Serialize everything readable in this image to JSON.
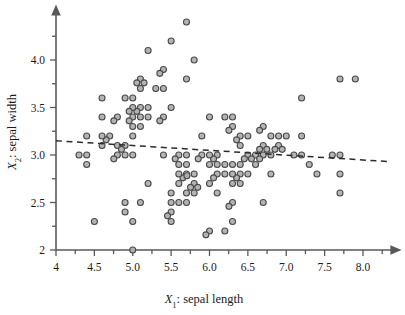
{
  "figure": {
    "background_color": "#ffffff",
    "marker_fill": "#b0b0b0",
    "marker_stroke": "#4a4a4a",
    "axis_color": "#58585a",
    "fitline_color": "#2b2b2b"
  },
  "axes": {
    "x_title_var": "X",
    "x_title_sub": "1",
    "x_title_rest": ": sepal length",
    "x_title_full": "X1: sepal length",
    "y_title_var": "X",
    "y_title_sub": "2",
    "y_title_rest": ": sepal width",
    "y_title_full": "X2: sepal width",
    "x_tick_labels": [
      "4",
      "4.5",
      "5.0",
      "5.5",
      "6.0",
      "6.5",
      "7.0",
      "7.5",
      "8.0"
    ],
    "y_tick_labels": [
      "2",
      "2.5",
      "3.0",
      "3.5",
      "4.0"
    ]
  },
  "chart_data": {
    "type": "scatter",
    "title": "",
    "xlabel": "X1: sepal length",
    "ylabel": "X2: sepal width",
    "xlim": [
      4.0,
      8.35
    ],
    "ylim": [
      2.0,
      4.45
    ],
    "xticks": [
      4.0,
      4.5,
      5.0,
      5.5,
      6.0,
      6.5,
      7.0,
      7.5,
      8.0
    ],
    "xtick_labels": [
      "4",
      "4.5",
      "5.0",
      "5.5",
      "6.0",
      "6.5",
      "7.0",
      "7.5",
      "8.0"
    ],
    "yticks": [
      2.0,
      2.5,
      3.0,
      3.5,
      4.0
    ],
    "ytick_labels": [
      "2",
      "2.5",
      "3.0",
      "3.5",
      "4.0"
    ],
    "grid": false,
    "legend": null,
    "marker": "circle",
    "marker_size": 6,
    "x": [
      5.1,
      4.9,
      4.7,
      4.6,
      5.0,
      5.4,
      4.6,
      5.0,
      4.4,
      4.9,
      5.4,
      4.8,
      4.8,
      4.3,
      5.8,
      5.7,
      5.4,
      5.1,
      5.7,
      5.1,
      5.4,
      5.1,
      4.6,
      5.1,
      4.8,
      5.0,
      5.0,
      5.2,
      5.2,
      4.7,
      4.8,
      5.4,
      5.2,
      5.5,
      4.9,
      5.0,
      5.5,
      4.9,
      4.4,
      5.1,
      5.0,
      4.5,
      4.4,
      5.0,
      5.1,
      4.8,
      5.1,
      4.6,
      5.3,
      5.0,
      7.0,
      6.4,
      6.9,
      5.5,
      6.5,
      5.7,
      6.3,
      4.9,
      6.6,
      5.2,
      5.0,
      5.9,
      6.0,
      6.1,
      5.6,
      6.7,
      5.6,
      5.8,
      6.2,
      5.6,
      5.9,
      6.1,
      6.3,
      6.1,
      6.4,
      6.6,
      6.8,
      6.7,
      6.0,
      5.7,
      5.5,
      5.5,
      5.8,
      6.0,
      5.4,
      6.0,
      6.7,
      6.3,
      5.6,
      5.5,
      5.5,
      6.1,
      5.8,
      5.0,
      5.6,
      5.7,
      5.7,
      6.2,
      5.1,
      5.7,
      6.3,
      5.8,
      7.1,
      6.3,
      6.5,
      7.6,
      4.9,
      7.3,
      6.7,
      7.2,
      6.5,
      6.4,
      6.8,
      5.7,
      5.8,
      6.4,
      6.5,
      7.7,
      7.7,
      6.0,
      6.9,
      5.6,
      7.7,
      6.3,
      6.7,
      7.2,
      6.2,
      6.1,
      6.4,
      7.2,
      7.4,
      7.9,
      6.4,
      6.3,
      6.1,
      7.7,
      6.3,
      6.4,
      6.0,
      6.9,
      6.7,
      6.9,
      5.8,
      6.8,
      6.7,
      6.7,
      6.3,
      6.5,
      6.2,
      5.9
    ],
    "y": [
      3.5,
      3.0,
      3.2,
      3.1,
      3.6,
      3.9,
      3.4,
      3.4,
      2.9,
      3.1,
      3.7,
      3.4,
      3.0,
      3.0,
      4.0,
      4.4,
      3.9,
      3.5,
      3.8,
      3.8,
      3.4,
      3.7,
      3.6,
      3.3,
      3.4,
      3.0,
      3.4,
      3.5,
      3.4,
      3.2,
      3.1,
      3.4,
      4.1,
      4.2,
      3.1,
      3.2,
      3.5,
      3.6,
      3.0,
      3.4,
      3.5,
      2.3,
      3.2,
      3.5,
      3.8,
      3.0,
      3.8,
      3.2,
      3.7,
      3.3,
      3.2,
      3.2,
      3.1,
      2.3,
      2.8,
      2.8,
      3.3,
      2.4,
      2.9,
      2.7,
      2.0,
      3.0,
      2.2,
      2.9,
      2.9,
      3.1,
      3.0,
      2.7,
      2.2,
      2.5,
      3.2,
      2.8,
      2.5,
      2.8,
      2.9,
      3.0,
      2.8,
      3.0,
      2.9,
      2.6,
      2.4,
      2.4,
      2.7,
      2.7,
      3.0,
      3.4,
      3.1,
      2.3,
      3.0,
      2.5,
      2.6,
      3.0,
      2.6,
      2.3,
      2.7,
      3.0,
      2.9,
      2.9,
      2.5,
      2.8,
      3.3,
      2.7,
      3.0,
      2.9,
      3.0,
      3.0,
      2.5,
      2.9,
      2.5,
      3.6,
      3.2,
      2.7,
      3.0,
      2.5,
      2.8,
      3.2,
      3.0,
      3.8,
      2.6,
      2.2,
      3.2,
      2.8,
      2.8,
      2.7,
      3.3,
      3.2,
      2.8,
      3.0,
      2.8,
      3.0,
      2.8,
      3.8,
      2.8,
      2.8,
      2.6,
      3.0,
      3.4,
      3.1,
      3.0,
      3.1,
      3.1,
      3.1,
      2.7,
      3.2,
      3.3,
      3.0,
      2.5,
      3.0,
      3.4,
      3.0
    ],
    "fit_line": {
      "style": "dashed",
      "x_start": 4.0,
      "y_start": 3.15,
      "x_end": 8.35,
      "y_end": 2.93,
      "slope": -0.0506,
      "intercept": 3.3525
    }
  }
}
